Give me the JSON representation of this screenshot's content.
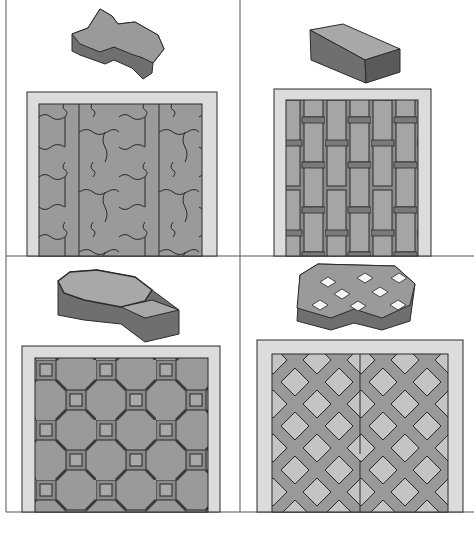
{
  "figure": {
    "panels": [
      {
        "id": "zigzag",
        "block": "zigzag-interlocking-paver",
        "pattern": "herringbone-interlock"
      },
      {
        "id": "rectangle",
        "block": "rectangular-brick-paver",
        "pattern": "stretcher-bond-vertical"
      },
      {
        "id": "octagon",
        "block": "octagon-square-paver",
        "pattern": "octagon-and-square"
      },
      {
        "id": "grass",
        "block": "grass-grid-paver",
        "pattern": "lattice-with-openings"
      }
    ],
    "colors": {
      "paver": "#9a9a9a",
      "paver_side": "#6f6f6f",
      "paver_side_dark": "#5a5a5a",
      "paver_top_light": "#b8b8b8",
      "edging": "#dcdcdc",
      "outline": "#2a2a2a",
      "divider": "#555555",
      "opening": "#c4c4c4"
    },
    "caption": ""
  }
}
